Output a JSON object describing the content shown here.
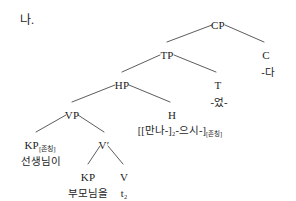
{
  "figure": {
    "item_label": "나.",
    "type": "syntax-tree",
    "language": "Korean",
    "background_color": "#ffffff",
    "line_color": "#4a4a4a",
    "text_color": "#1c1c1c"
  },
  "tree": {
    "nodes": [
      {
        "id": "CP",
        "label": "CP",
        "x": 218,
        "y": 20,
        "kind": "phrase"
      },
      {
        "id": "TP",
        "label": "TP",
        "x": 167,
        "y": 50,
        "kind": "phrase"
      },
      {
        "id": "C",
        "label": "C",
        "x": 266,
        "y": 50,
        "kind": "head"
      },
      {
        "id": "HP",
        "label": "HP",
        "x": 122,
        "y": 80,
        "kind": "phrase"
      },
      {
        "id": "T",
        "label": "T",
        "x": 218,
        "y": 80,
        "kind": "head"
      },
      {
        "id": "VP",
        "label": "VP",
        "x": 72,
        "y": 110,
        "kind": "phrase"
      },
      {
        "id": "H",
        "label": "H",
        "x": 172,
        "y": 110,
        "kind": "head"
      },
      {
        "id": "KP1",
        "label": "KP",
        "x": 40,
        "y": 140,
        "kind": "phrase",
        "subscript": "[존칭]"
      },
      {
        "id": "Vbar",
        "label": "V′",
        "x": 104,
        "y": 140,
        "kind": "bar"
      },
      {
        "id": "KP2",
        "label": "KP",
        "x": 88,
        "y": 172,
        "kind": "phrase"
      },
      {
        "id": "V",
        "label": "V",
        "x": 124,
        "y": 172,
        "kind": "head"
      }
    ],
    "terminals": [
      {
        "id": "C-term",
        "parent": "C",
        "text": "-다",
        "x": 268,
        "y": 68
      },
      {
        "id": "T-term",
        "parent": "T",
        "text": "-었-",
        "x": 219,
        "y": 98
      },
      {
        "id": "H-term",
        "parent": "H",
        "text": "[[만나-]₂-으시-]",
        "subscript": "[존칭]",
        "x": 180,
        "y": 126
      },
      {
        "id": "KP1-term",
        "parent": "KP1",
        "text": "선생님이",
        "x": 41,
        "y": 157
      },
      {
        "id": "KP2-term",
        "parent": "KP2",
        "text": "부모님을",
        "x": 88,
        "y": 189
      },
      {
        "id": "V-term",
        "parent": "V",
        "text": "t₂",
        "x": 124,
        "y": 189
      }
    ],
    "edges": [
      {
        "id": "cp-tp",
        "from": "CP",
        "to": "TP",
        "x1": 212,
        "y1": 25,
        "x2": 167,
        "y2": 42
      },
      {
        "id": "cp-c",
        "from": "CP",
        "to": "C",
        "x1": 225,
        "y1": 25,
        "x2": 264,
        "y2": 42
      },
      {
        "id": "tp-hp",
        "from": "TP",
        "to": "HP",
        "x1": 160,
        "y1": 55,
        "x2": 122,
        "y2": 72
      },
      {
        "id": "tp-t",
        "from": "TP",
        "to": "T",
        "x1": 174,
        "y1": 55,
        "x2": 216,
        "y2": 72
      },
      {
        "id": "hp-vp",
        "from": "HP",
        "to": "VP",
        "x1": 115,
        "y1": 85,
        "x2": 72,
        "y2": 102
      },
      {
        "id": "hp-h",
        "from": "HP",
        "to": "H",
        "x1": 129,
        "y1": 85,
        "x2": 170,
        "y2": 102
      },
      {
        "id": "vp-kp1",
        "from": "VP",
        "to": "KP1",
        "x1": 66,
        "y1": 115,
        "x2": 36,
        "y2": 132
      },
      {
        "id": "vp-vbar",
        "from": "VP",
        "to": "Vbar",
        "x1": 78,
        "y1": 115,
        "x2": 104,
        "y2": 132
      },
      {
        "id": "vbar-kp2",
        "from": "Vbar",
        "to": "KP2",
        "x1": 100,
        "y1": 146,
        "x2": 88,
        "y2": 164
      },
      {
        "id": "vbar-v",
        "from": "Vbar",
        "to": "V",
        "x1": 108,
        "y1": 146,
        "x2": 123,
        "y2": 164
      }
    ]
  }
}
